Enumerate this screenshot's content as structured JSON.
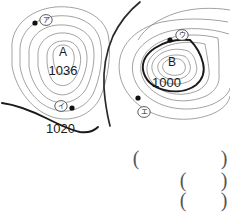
{
  "figure": {
    "background_color": "#ffffff",
    "line_color_thin": "#8a8a8a",
    "line_color_bold": "#1a1a1a"
  },
  "pressure_systems": [
    {
      "id": "A",
      "letter": "A",
      "pressure": "1036",
      "type": "high",
      "cx": 63,
      "cy": 57
    },
    {
      "id": "B",
      "letter": "B",
      "pressure": "1000",
      "type": "low",
      "cx": 170,
      "cy": 62
    }
  ],
  "isobar_labels": [
    {
      "value": "1020",
      "x": 62,
      "y": 125
    },
    {
      "value": "1000",
      "x": 152,
      "y": 80
    }
  ],
  "station_markers": [
    {
      "id": "a",
      "label": "ア",
      "dot_x": 35,
      "dot_y": 23,
      "ring_x": 46,
      "ring_y": 20
    },
    {
      "id": "i",
      "label": "イ",
      "dot_x": 72,
      "dot_y": 108,
      "ring_x": 61,
      "ring_y": 106
    },
    {
      "id": "u",
      "label": "ウ",
      "dot_x": 170,
      "dot_y": 40,
      "ring_x": 182,
      "ring_y": 35
    },
    {
      "id": "e",
      "label": "エ",
      "dot_x": 138,
      "dot_y": 98,
      "ring_x": 144,
      "ring_y": 112
    }
  ],
  "answer_blanks": [
    {
      "id": "blank-1",
      "open": "(",
      "close": ")",
      "open_x": 136,
      "close_x": 224,
      "y": 158
    },
    {
      "id": "blank-2",
      "open": "(",
      "close": ")",
      "open_x": 183,
      "close_x": 224,
      "y": 180
    },
    {
      "id": "blank-3",
      "open": "(",
      "close": ")",
      "open_x": 183,
      "close_x": 224,
      "y": 200
    }
  ],
  "cut_off_caption": {
    "text": "",
    "x": 6,
    "y": 216
  }
}
